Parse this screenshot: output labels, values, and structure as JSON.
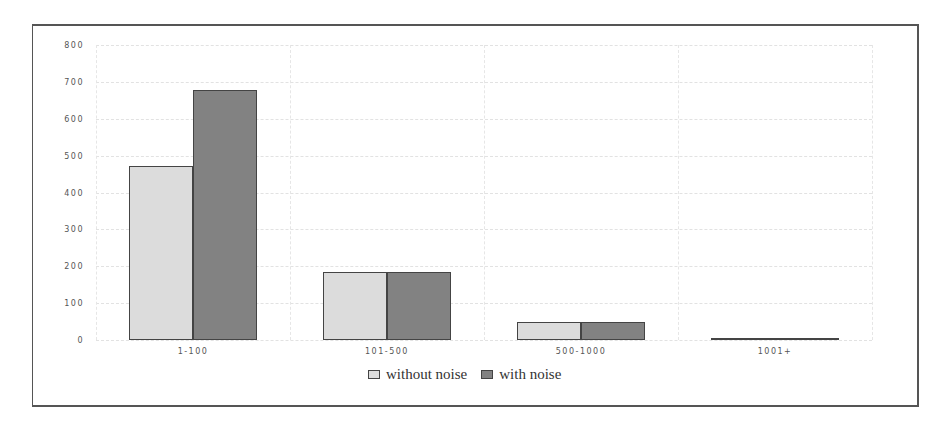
{
  "chart_data": {
    "type": "bar",
    "title": "",
    "xlabel": "",
    "ylabel": "",
    "categories": [
      "1-100",
      "101-500",
      "500-1000",
      "1001+"
    ],
    "series": [
      {
        "name": "without noise",
        "color": "#dcdcdc",
        "values": [
          472,
          184,
          49,
          3
        ]
      },
      {
        "name": "with noise",
        "color": "#828282",
        "values": [
          678,
          184,
          49,
          3
        ]
      }
    ],
    "ylim": [
      0,
      800
    ],
    "yticks": [
      "0",
      "100",
      "200",
      "300",
      "400",
      "500",
      "600",
      "700",
      "800"
    ],
    "grid": true,
    "legend_position": "bottom"
  },
  "legend": {
    "items": [
      "without noise",
      "with noise"
    ]
  }
}
